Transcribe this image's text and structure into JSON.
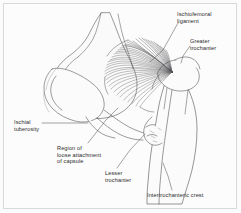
{
  "figure": {
    "background_color": "#fbfbfb",
    "frame_color": "#d9d9dc",
    "ink_color": "#3a3a3a",
    "text_color": "#2b2b2b"
  },
  "labels": {
    "ischiofemoral_ligament": "Ischiofemoral\nligament",
    "greater_trochanter": "Greater\ntrochanter",
    "ischial_tuberosity": "Ischial\ntuberosity",
    "region_of_loose_attachment": "Region of\nloose attachment\nof capsule",
    "lesser_trochanter": "Lesser\ntrochanter",
    "intertrochanteric_crest": "Intertrochanteric crest"
  },
  "structures": {
    "pelvis": "ischium and posterior pelvic outline",
    "femur": "proximal femur, posterior aspect",
    "ligament_fibers": "radiating ischiofemoral ligament fibers converging on the greater trochanter",
    "fiber_count": 44
  }
}
